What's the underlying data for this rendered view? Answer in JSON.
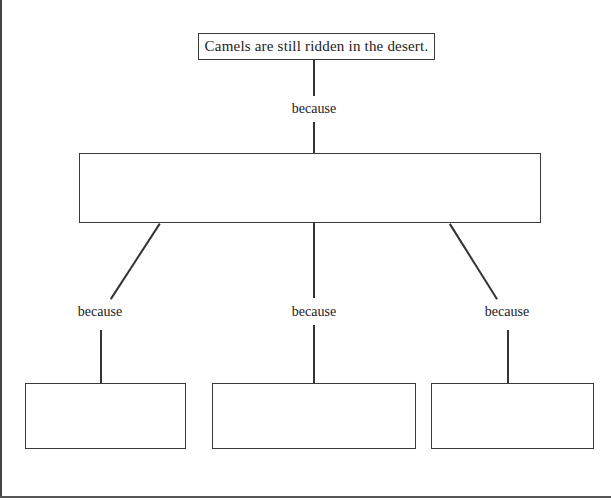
{
  "diagram": {
    "type": "tree",
    "root": {
      "text": "Camels are still ridden in the desert."
    },
    "connector_labels": {
      "root_to_middle": "because",
      "middle_to_left": "because",
      "middle_to_center": "because",
      "middle_to_right": "because"
    },
    "middle_box": {
      "text": ""
    },
    "leaf_boxes": [
      {
        "text": ""
      },
      {
        "text": ""
      },
      {
        "text": ""
      }
    ]
  }
}
